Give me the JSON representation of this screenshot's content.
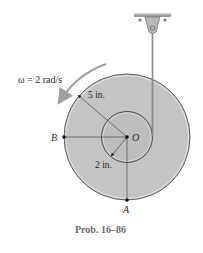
{
  "figure": {
    "omega_label": "ω = 2 rad/s",
    "outer_radius_label": "5 in.",
    "inner_radius_label": "2 in.",
    "point_b": "B",
    "point_o": "O",
    "point_a": "A",
    "caption": "Prob. 16–86"
  },
  "colors": {
    "disk_fill": "#c4c4c4",
    "hub_fill": "#bdbdbd",
    "edge": "#5a5a5a",
    "arrow": "#9a9a9a"
  }
}
